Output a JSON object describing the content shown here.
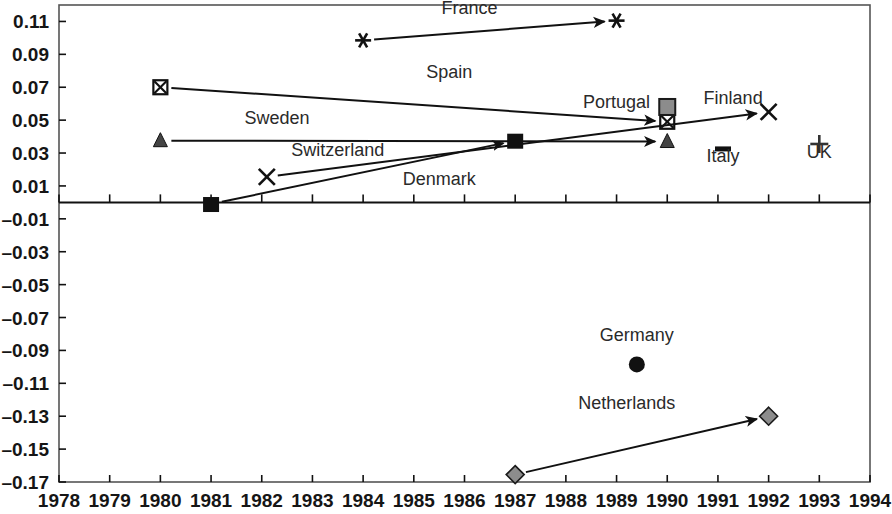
{
  "chart_data": {
    "type": "scatter",
    "title": "",
    "xlabel": "",
    "ylabel": "",
    "xlim": [
      1978,
      1994
    ],
    "ylim": [
      -0.17,
      0.12
    ],
    "grid": false,
    "legend": "none",
    "xticks": [
      "1978",
      "1979",
      "1980",
      "1981",
      "1982",
      "1983",
      "1984",
      "1985",
      "1986",
      "1987",
      "1988",
      "1989",
      "1990",
      "1991",
      "1992",
      "1993",
      "1994"
    ],
    "yticks": [
      "0.11",
      "0.09",
      "0.07",
      "0.05",
      "0.03",
      "0.01",
      "–0.01",
      "–0.03",
      "–0.05",
      "–0.07",
      "–0.09",
      "–0.11",
      "–0.13",
      "–0.15",
      "–0.17"
    ],
    "ytick_values": [
      0.11,
      0.09,
      0.07,
      0.05,
      0.03,
      0.01,
      -0.01,
      -0.03,
      -0.05,
      -0.07,
      -0.09,
      -0.11,
      -0.13,
      -0.15,
      -0.17
    ],
    "zero_line": 0.0,
    "series": [
      {
        "name": "France",
        "label": "France",
        "marker": "asterisk",
        "color": "#111111",
        "arrow": true,
        "label_x": 1986.1,
        "label_y": 0.1145,
        "points": [
          {
            "x": 1984.0,
            "y": 0.0985
          },
          {
            "x": 1989.0,
            "y": 0.1105
          }
        ]
      },
      {
        "name": "Spain",
        "label": "Spain",
        "marker": "box-x",
        "color": "#111111",
        "arrow": true,
        "label_x": 1985.7,
        "label_y": 0.0755,
        "points": [
          {
            "x": 1980.0,
            "y": 0.07
          },
          {
            "x": 1990.0,
            "y": 0.049
          }
        ]
      },
      {
        "name": "Sweden",
        "label": "Sweden",
        "marker": "triangle",
        "color": "#444444",
        "arrow": true,
        "label_x": 1982.3,
        "label_y": 0.0475,
        "points": [
          {
            "x": 1980.0,
            "y": 0.0375
          },
          {
            "x": 1990.0,
            "y": 0.037
          }
        ]
      },
      {
        "name": "Switzerland",
        "label": "Switzerland",
        "marker": "x",
        "color": "#111111",
        "arrow": true,
        "label_x": 1983.5,
        "label_y": 0.0285,
        "points": [
          {
            "x": 1982.1,
            "y": 0.0155
          },
          {
            "x": 1992.0,
            "y": 0.055
          }
        ]
      },
      {
        "name": "Denmark",
        "label": "Denmark",
        "marker": "filled-square",
        "color": "#111111",
        "arrow": true,
        "label_x": 1985.5,
        "label_y": 0.0105,
        "points": [
          {
            "x": 1981.0,
            "y": -0.001
          },
          {
            "x": 1987.0,
            "y": 0.0375
          }
        ]
      },
      {
        "name": "Portugal",
        "label": "Portugal",
        "marker": "none",
        "color": "#111111",
        "arrow": false,
        "label_x": 1989.0,
        "label_y": 0.0575,
        "points": []
      },
      {
        "name": "Finland",
        "label": "Finland",
        "marker": "gray-square",
        "color": "#8c8c8c",
        "arrow": false,
        "label_x": 1991.3,
        "label_y": 0.06,
        "points": [
          {
            "x": 1990.0,
            "y": 0.058
          }
        ]
      },
      {
        "name": "Italy",
        "label": "Italy",
        "marker": "dash",
        "color": "#111111",
        "arrow": false,
        "label_x": 1991.1,
        "label_y": 0.0245,
        "points": [
          {
            "x": 1991.1,
            "y": 0.0325
          }
        ]
      },
      {
        "name": "UK",
        "label": "UK",
        "marker": "plus",
        "color": "#333333",
        "arrow": false,
        "label_x": 1993.0,
        "label_y": 0.027,
        "points": [
          {
            "x": 1993.0,
            "y": 0.0355
          }
        ]
      },
      {
        "name": "Germany",
        "label": "Germany",
        "marker": "filled-circle",
        "color": "#111111",
        "arrow": false,
        "label_x": 1989.4,
        "label_y": -0.0845,
        "points": [
          {
            "x": 1989.4,
            "y": -0.0985
          }
        ]
      },
      {
        "name": "Netherlands",
        "label": "Netherlands",
        "marker": "gray-diamond",
        "color": "#8c8c8c",
        "arrow": true,
        "label_x": 1989.2,
        "label_y": -0.1255,
        "points": [
          {
            "x": 1987.0,
            "y": -0.1655
          },
          {
            "x": 1992.0,
            "y": -0.13
          }
        ]
      }
    ]
  }
}
